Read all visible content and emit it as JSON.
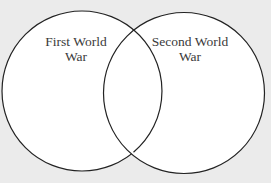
{
  "diagram": {
    "type": "venn",
    "sets": [
      {
        "label_line1": "First World",
        "label_line2": "War"
      },
      {
        "label_line1": "Second World",
        "label_line2": "War"
      }
    ],
    "colors": {
      "background": "#ebebeb",
      "fill": "#ffffff",
      "stroke": "#222222"
    }
  }
}
